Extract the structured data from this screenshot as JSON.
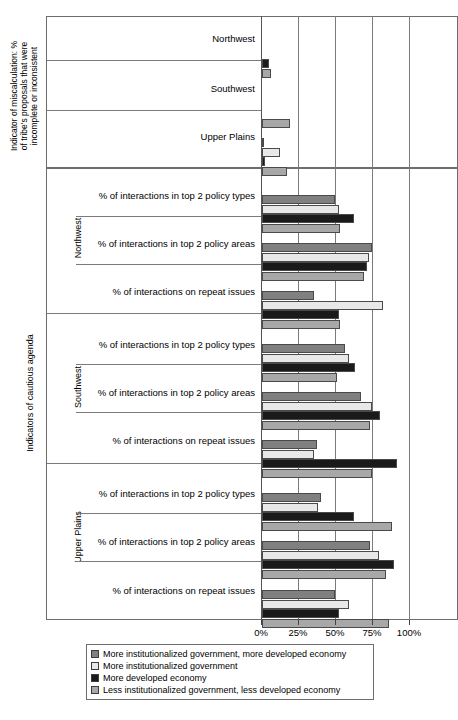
{
  "chart_data": {
    "type": "bar",
    "orientation": "horizontal",
    "title": "",
    "xlabel": "",
    "ylabel": "",
    "xlim": [
      0,
      100
    ],
    "xticks": [
      "0%",
      "25%",
      "50%",
      "75%",
      "100%"
    ],
    "xtick_values": [
      0,
      25,
      50,
      75,
      100
    ],
    "grid": true,
    "legend_position": "bottom",
    "series": [
      {
        "name": "More institutionalized government, more developed economy",
        "color": "#808080"
      },
      {
        "name": "More institutionalized government",
        "color": "#e8e8e8"
      },
      {
        "name": "More developed economy",
        "color": "#1a1a1a"
      },
      {
        "name": "Less institutionalized government, less developed economy",
        "color": "#a8a8a8"
      }
    ],
    "panels": [
      {
        "panel_label": "Indicator of miscalculation: %\nof tribe's proposals that were\nincomplete or inconsistent",
        "groups": [
          {
            "region": "",
            "categories": [
              {
                "label": "Northwest",
                "values": [
                  0,
                  0,
                  5,
                  6
                ]
              },
              {
                "label": "Southwest",
                "values": [
                  0,
                  0,
                  0,
                  19
                ]
              },
              {
                "label": "Upper Plains",
                "values": [
                  1,
                  12,
                  2,
                  17
                ]
              }
            ]
          }
        ]
      },
      {
        "panel_label": "Indicators of cautious agenda",
        "groups": [
          {
            "region": "Northwest",
            "categories": [
              {
                "label": "% of interactions in top 2 policy types",
                "values": [
                  49,
                  52,
                  62,
                  53
                ]
              },
              {
                "label": "% of interactions in top 2 policy areas",
                "values": [
                  74,
                  72,
                  71,
                  69
                ]
              },
              {
                "label": "% of interactions on repeat issues",
                "values": [
                  35,
                  82,
                  52,
                  53
                ]
              }
            ]
          },
          {
            "region": "Southwest",
            "categories": [
              {
                "label": "% of interactions in top 2 policy types",
                "values": [
                  56,
                  59,
                  63,
                  51
                ]
              },
              {
                "label": "% of interactions in top 2 policy areas",
                "values": [
                  67,
                  74,
                  80,
                  73
                ]
              },
              {
                "label": "% of interactions on repeat issues",
                "values": [
                  37,
                  35,
                  91,
                  74
                ]
              }
            ]
          },
          {
            "region": "Upper Plains",
            "categories": [
              {
                "label": "% of interactions in top 2 policy types",
                "values": [
                  40,
                  38,
                  62,
                  88
                ]
              },
              {
                "label": "% of interactions in top 2 policy areas",
                "values": [
                  73,
                  79,
                  89,
                  84
                ]
              },
              {
                "label": "% of interactions on repeat issues",
                "values": [
                  49,
                  59,
                  52,
                  86
                ]
              }
            ]
          }
        ]
      }
    ]
  },
  "legend": {
    "items": [
      {
        "label": "More institutionalized government, more developed economy",
        "color": "#808080"
      },
      {
        "label": "More institutionalized government",
        "color": "#e8e8e8"
      },
      {
        "label": "More developed economy",
        "color": "#1a1a1a"
      },
      {
        "label": "Less institutionalized government, less developed economy",
        "color": "#a8a8a8"
      }
    ]
  },
  "axis": {
    "panel_top_caption": "Indicator of miscalculation: %\nof tribe's proposals that were\nincomplete or inconsistent",
    "panel_bottom_caption": "Indicators of cautious agenda",
    "region_northwest": "Northwest",
    "region_southwest": "Southwest",
    "region_upper_plains": "Upper Plains"
  }
}
